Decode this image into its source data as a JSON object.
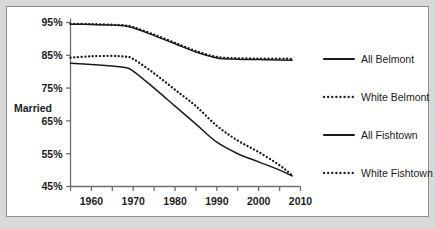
{
  "figure": {
    "background_color": "#d9d9d9",
    "plate_color": "#ffffff",
    "plate_border_color": "#8e8e8e",
    "ink_color": "#1b1b1b",
    "axis_color": "#6f6f6f"
  },
  "axis": {
    "y_title": "Married",
    "y_ticks": [
      "95%",
      "85%",
      "75%",
      "65%",
      "55%",
      "45%"
    ],
    "x_ticks": [
      "1960",
      "1970",
      "1980",
      "1990",
      "2000",
      "2010"
    ]
  },
  "legend": {
    "items": [
      {
        "label": "All Belmont",
        "style": "solid",
        "swatch": "solid-line-swatch"
      },
      {
        "label": "White Belmont",
        "style": "dotted",
        "swatch": "dotted-line-swatch"
      },
      {
        "label": "All Fishtown",
        "style": "solid",
        "swatch": "solid-line-swatch"
      },
      {
        "label": "White Fishtown",
        "style": "dotted",
        "swatch": "dotted-line-swatch"
      }
    ]
  },
  "chart_data": {
    "type": "line",
    "title": "",
    "xlabel": "",
    "ylabel": "Married",
    "xlim": [
      1955,
      2010
    ],
    "ylim": [
      45,
      95
    ],
    "grid": false,
    "legend_position": "right",
    "x_tick_values": [
      1960,
      1970,
      1980,
      1990,
      2000,
      2010
    ],
    "x_minor_tick_values": [
      1955,
      1965,
      1975,
      1985,
      1995,
      2005
    ],
    "y_tick_values": [
      45,
      55,
      65,
      75,
      85,
      95
    ],
    "x": [
      1955,
      1960,
      1965,
      1968,
      1970,
      1975,
      1980,
      1985,
      1990,
      1995,
      2000,
      2005,
      2008
    ],
    "series": [
      {
        "name": "All Belmont",
        "style": "solid",
        "values": [
          94.5,
          94.4,
          94.2,
          94.0,
          93.4,
          91.0,
          88.5,
          86.0,
          84.2,
          83.8,
          83.7,
          83.6,
          83.5
        ]
      },
      {
        "name": "White Belmont",
        "style": "dotted",
        "values": [
          94.6,
          94.5,
          94.3,
          94.1,
          93.6,
          91.3,
          88.8,
          86.3,
          84.5,
          84.1,
          84.0,
          84.0,
          83.9
        ]
      },
      {
        "name": "All Fishtown",
        "style": "solid",
        "values": [
          82.6,
          82.2,
          81.7,
          81.3,
          80.2,
          75.0,
          69.5,
          64.0,
          58.5,
          55.0,
          52.5,
          50.0,
          48.2
        ]
      },
      {
        "name": "White Fishtown",
        "style": "dotted",
        "values": [
          84.3,
          84.7,
          84.8,
          84.6,
          83.9,
          79.5,
          74.5,
          69.5,
          63.5,
          59.0,
          55.5,
          51.5,
          48.4
        ]
      }
    ]
  }
}
